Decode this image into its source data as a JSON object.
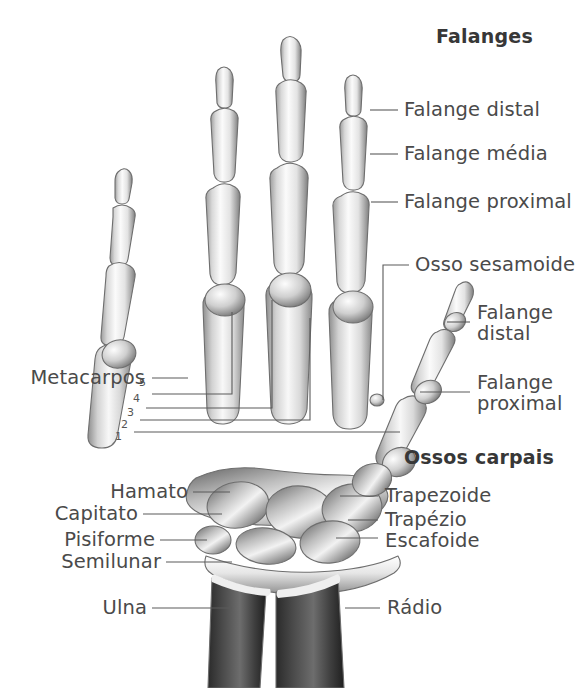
{
  "figure": {
    "title_group_top": "Falanges",
    "title_group_carpals": "Ossos carpais",
    "view": "hand-skeleton-dorsal"
  },
  "labels": {
    "falange_distal": "Falange distal",
    "falange_media": "Falange média",
    "falange_proximal": "Falange proximal",
    "osso_sesamoide": "Osso sesamoide",
    "thumb_distal_l1": "Falange",
    "thumb_distal_l2": "distal",
    "thumb_proximal_l1": "Falange",
    "thumb_proximal_l2": "proximal",
    "metacarpos": "Metacarpos",
    "hamato": "Hamato",
    "capitato": "Capitato",
    "pisiforme": "Pisiforme",
    "semilunar": "Semilunar",
    "ulna": "Ulna",
    "radio": "Rádio",
    "trapezoide": "Trapezoide",
    "trapezio": "Trapézio",
    "escafoide": "Escafoide"
  },
  "metacarpal_numbers": [
    "5",
    "4",
    "3",
    "2",
    "1"
  ],
  "colors": {
    "background": "#ffffff",
    "text": "#4a4a4a",
    "text_bold": "#373737",
    "leader_line": "#5a5a5a",
    "bone_light": "#f4f4f4",
    "bone_mid": "#c9c9c9",
    "bone_shadow": "#8d8d8d",
    "bone_dark": "#3b3b3b",
    "bone_outline": "#6e6e6e"
  }
}
